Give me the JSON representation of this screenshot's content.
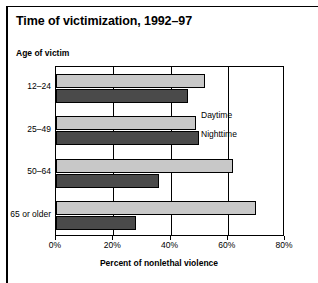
{
  "chart_data": {
    "type": "bar",
    "orientation": "horizontal",
    "title": "Time of victimization, 1992–97",
    "categories": [
      "12–24",
      "25–49",
      "50–64",
      "65 or older"
    ],
    "series": [
      {
        "name": "Daytime",
        "values": [
          52,
          49,
          62,
          70
        ],
        "color": "#c8c8c8"
      },
      {
        "name": "Nighttime",
        "values": [
          46,
          50,
          36,
          28
        ],
        "color": "#4a4a4a"
      }
    ],
    "xlabel": "Percent of nonlethal violence",
    "ylabel": "Age of victim",
    "xlim": [
      0,
      80
    ],
    "xticks": [
      "0%",
      "20%",
      "40%",
      "60%",
      "80%"
    ],
    "xtick_values": [
      0,
      20,
      40,
      60,
      80
    ],
    "grid": true,
    "legend_position": "inside-right"
  }
}
